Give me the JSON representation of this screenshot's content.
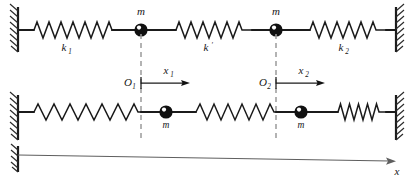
{
  "figure": {
    "axis_label": "x",
    "colors": {
      "line": "#1b1b1b",
      "dashed_guide": "#9b9b9b",
      "axis": "#5e5e5e",
      "mass_fill": "#111111",
      "background": "#ffffff"
    }
  },
  "top_system": {
    "caption": "equilibrium configuration",
    "springs": [
      {
        "name": "left-spring",
        "label": "k",
        "subscript": "1",
        "state": "relaxed"
      },
      {
        "name": "coupling-spring",
        "label": "k",
        "subscript": "′",
        "state": "relaxed"
      },
      {
        "name": "right-spring",
        "label": "k",
        "subscript": "2",
        "state": "relaxed"
      }
    ],
    "masses": [
      {
        "name": "mass-1",
        "label": "m"
      },
      {
        "name": "mass-2",
        "label": "m"
      }
    ]
  },
  "bottom_system": {
    "caption": "displaced configuration",
    "springs": [
      {
        "name": "left-spring",
        "label": "",
        "subscript": "",
        "state": "stretched"
      },
      {
        "name": "coupling-spring",
        "label": "",
        "subscript": "",
        "state": "stretched"
      },
      {
        "name": "right-spring",
        "label": "",
        "subscript": "",
        "state": "compressed"
      }
    ],
    "masses": [
      {
        "name": "mass-1",
        "label": "m"
      },
      {
        "name": "mass-2",
        "label": "m"
      }
    ]
  },
  "origins": [
    {
      "name": "origin-1",
      "label": "O",
      "subscript": "1",
      "displacement": "x",
      "displacement_subscript": "1"
    },
    {
      "name": "origin-2",
      "label": "O",
      "subscript": "2",
      "displacement": "x",
      "displacement_subscript": "2"
    }
  ],
  "axis": {
    "label": "x",
    "direction": "right"
  }
}
